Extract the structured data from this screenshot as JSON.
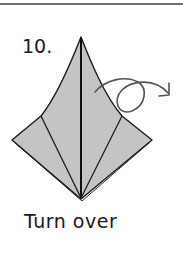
{
  "step": {
    "number": "10.",
    "instruction": "Turn over"
  },
  "diagram": {
    "paper_color": "#c4c4c4",
    "line_color": "#1a1a1a",
    "arrow_color": "#555555",
    "arrow_type": "turn-over-loop-arrow"
  },
  "colors": {
    "background": "#ffffff",
    "rule": "#6e6e6e"
  }
}
